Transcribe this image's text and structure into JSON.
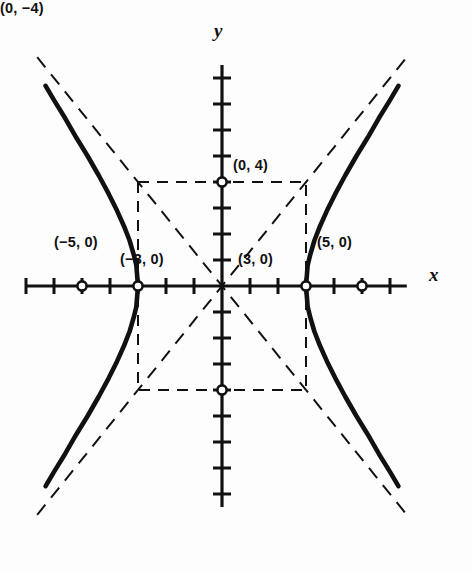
{
  "figure": {
    "background_color": "#fdfdfd",
    "ink_color": "#111111"
  },
  "axes": {
    "x_axis_label": "x",
    "y_axis_label": "y",
    "x_range": [
      -7,
      6.6
    ],
    "y_range": [
      -8.5,
      8.5
    ],
    "tick_interval": 1,
    "grid": false
  },
  "labels": {
    "focus_left": "(−5, 0)",
    "vertex_left": "(−3, 0)",
    "vertex_right": "(3, 0)",
    "focus_right": "(5, 0)",
    "covertex_top": "(0, 4)",
    "covertex_bottom": "(0, −4)"
  },
  "chart_data": {
    "type": "line",
    "xlabel": "x",
    "ylabel": "y",
    "xlim": [
      -7,
      6.6
    ],
    "ylim": [
      -8.5,
      8.5
    ],
    "grid": false,
    "legend": "none",
    "curve_equation": "x^2/9 - y^2/16 = 1",
    "a": 3,
    "b": 4,
    "c": 5,
    "center": [
      0,
      0
    ],
    "vertices": [
      [
        -3,
        0
      ],
      [
        3,
        0
      ]
    ],
    "foci": [
      [
        -5,
        0
      ],
      [
        5,
        0
      ]
    ],
    "covertices": [
      [
        0,
        4
      ],
      [
        0,
        -4
      ]
    ],
    "asymptote_slopes": [
      1.3333,
      -1.3333
    ],
    "asymptotes": [
      "y = (4/3)x",
      "y = -(4/3)x"
    ],
    "central_rectangle": {
      "x_min": -3,
      "x_max": 3,
      "y_min": -4,
      "y_max": 4,
      "style": "dashed"
    },
    "marked_points": [
      {
        "label": "(−5, 0)",
        "x": -5,
        "y": 0,
        "marker": "open-circle",
        "role": "focus"
      },
      {
        "label": "(−3, 0)",
        "x": -3,
        "y": 0,
        "marker": "open-circle",
        "role": "vertex"
      },
      {
        "label": "(3, 0)",
        "x": 3,
        "y": 0,
        "marker": "open-circle",
        "role": "vertex"
      },
      {
        "label": "(5, 0)",
        "x": 5,
        "y": 0,
        "marker": "open-circle",
        "role": "focus"
      },
      {
        "label": "(0, 4)",
        "x": 0,
        "y": 4,
        "marker": "open-circle",
        "role": "covertex"
      },
      {
        "label": "(0, −4)",
        "x": 0,
        "y": -4,
        "marker": "open-circle",
        "role": "covertex"
      }
    ],
    "series": [
      {
        "name": "right branch",
        "style": "solid-thick",
        "points": [
          [
            3,
            0
          ],
          [
            3.06,
            0.8
          ],
          [
            3.15,
            1.2
          ],
          [
            3.3,
            1.75
          ],
          [
            3.5,
            2.3
          ],
          [
            3.75,
            2.9
          ],
          [
            4.05,
            3.55
          ],
          [
            4.4,
            4.25
          ],
          [
            4.8,
            5.0
          ],
          [
            5.2,
            5.7
          ],
          [
            5.6,
            6.45
          ],
          [
            6.0,
            7.15
          ],
          [
            6.3,
            7.7
          ]
        ]
      },
      {
        "name": "right branch lower",
        "style": "solid-thick",
        "points": [
          [
            3,
            0
          ],
          [
            3.06,
            -0.8
          ],
          [
            3.15,
            -1.2
          ],
          [
            3.3,
            -1.75
          ],
          [
            3.5,
            -2.3
          ],
          [
            3.75,
            -2.9
          ],
          [
            4.05,
            -3.55
          ],
          [
            4.4,
            -4.25
          ],
          [
            4.8,
            -5.0
          ],
          [
            5.2,
            -5.7
          ],
          [
            5.6,
            -6.45
          ],
          [
            6.0,
            -7.15
          ],
          [
            6.3,
            -7.7
          ]
        ]
      },
      {
        "name": "left branch upper",
        "style": "solid-thick",
        "points": [
          [
            -3,
            0
          ],
          [
            -3.06,
            0.8
          ],
          [
            -3.15,
            1.2
          ],
          [
            -3.3,
            1.75
          ],
          [
            -3.5,
            2.3
          ],
          [
            -3.75,
            2.9
          ],
          [
            -4.05,
            3.55
          ],
          [
            -4.4,
            4.25
          ],
          [
            -4.8,
            5.0
          ],
          [
            -5.2,
            5.7
          ],
          [
            -5.6,
            6.45
          ],
          [
            -6.0,
            7.15
          ],
          [
            -6.3,
            7.7
          ]
        ]
      },
      {
        "name": "left branch lower",
        "style": "solid-thick",
        "points": [
          [
            -3,
            0
          ],
          [
            -3.06,
            -0.8
          ],
          [
            -3.15,
            -1.2
          ],
          [
            -3.3,
            -1.75
          ],
          [
            -3.5,
            -2.3
          ],
          [
            -3.75,
            -2.9
          ],
          [
            -4.05,
            -3.55
          ],
          [
            -4.4,
            -4.25
          ],
          [
            -4.8,
            -5.0
          ],
          [
            -5.2,
            -5.7
          ],
          [
            -5.6,
            -6.45
          ],
          [
            -6.0,
            -7.15
          ],
          [
            -6.3,
            -7.7
          ]
        ]
      }
    ]
  }
}
